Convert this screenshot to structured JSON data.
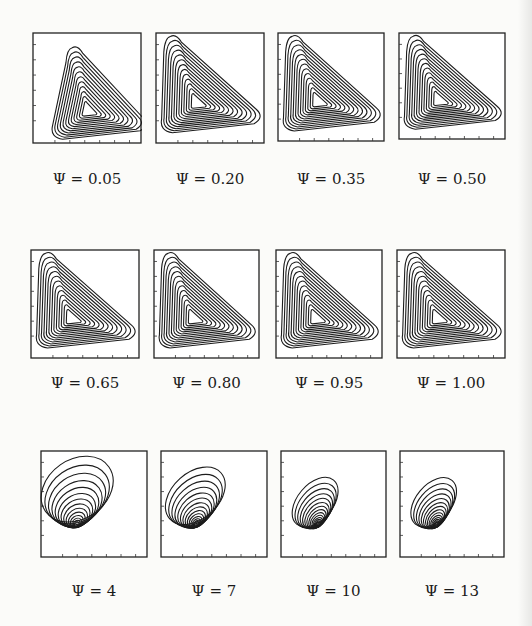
{
  "figure": {
    "rows": [
      {
        "shape": "triangle",
        "panels": [
          {
            "label": "Ψ = 0.05",
            "x": 32,
            "y": 32,
            "w": 110,
            "h": 112,
            "cap_y": 170,
            "variant": "tri-narrow"
          },
          {
            "label": "Ψ = 0.20",
            "x": 155,
            "y": 32,
            "w": 110,
            "h": 112,
            "cap_y": 170,
            "variant": "tri"
          },
          {
            "label": "Ψ = 0.35",
            "x": 277,
            "y": 32,
            "w": 108,
            "h": 110,
            "cap_y": 170,
            "variant": "tri"
          },
          {
            "label": "Ψ = 0.50",
            "x": 398,
            "y": 32,
            "w": 108,
            "h": 108,
            "cap_y": 170,
            "variant": "tri"
          }
        ]
      },
      {
        "shape": "triangle",
        "panels": [
          {
            "label": "Ψ = 0.65",
            "x": 30,
            "y": 249,
            "w": 110,
            "h": 110,
            "cap_y": 374,
            "variant": "tri-wide"
          },
          {
            "label": "Ψ = 0.80",
            "x": 153,
            "y": 249,
            "w": 107,
            "h": 110,
            "cap_y": 374,
            "variant": "tri-wide"
          },
          {
            "label": "Ψ = 0.95",
            "x": 275,
            "y": 249,
            "w": 108,
            "h": 110,
            "cap_y": 374,
            "variant": "tri-wide"
          },
          {
            "label": "Ψ = 1.00",
            "x": 396,
            "y": 249,
            "w": 110,
            "h": 110,
            "cap_y": 374,
            "variant": "tri-wide"
          }
        ]
      },
      {
        "shape": "ellipse",
        "panels": [
          {
            "label": "Ψ = 4",
            "x": 40,
            "y": 450,
            "w": 108,
            "h": 108,
            "cap_y": 582,
            "variant": "ell-wide"
          },
          {
            "label": "Ψ = 7",
            "x": 160,
            "y": 450,
            "w": 108,
            "h": 108,
            "cap_y": 582,
            "variant": "ell"
          },
          {
            "label": "Ψ = 10",
            "x": 280,
            "y": 450,
            "w": 107,
            "h": 108,
            "cap_y": 582,
            "variant": "ell-thin"
          },
          {
            "label": "Ψ = 13",
            "x": 399,
            "y": 450,
            "w": 106,
            "h": 108,
            "cap_y": 582,
            "variant": "ell-thin"
          }
        ]
      }
    ]
  }
}
